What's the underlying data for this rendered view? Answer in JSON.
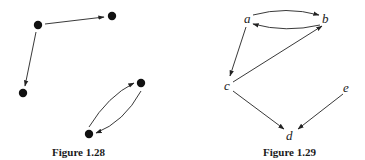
{
  "figures": [
    {
      "caption": "Figure 1.28",
      "nodes": [
        {
          "id": "n1",
          "x": 38,
          "y": 25
        },
        {
          "id": "n2",
          "x": 112,
          "y": 16
        },
        {
          "id": "n3",
          "x": 23,
          "y": 93
        },
        {
          "id": "n4",
          "x": 141,
          "y": 83
        },
        {
          "id": "n5",
          "x": 89,
          "y": 134
        }
      ],
      "edges": [
        {
          "from": "n1",
          "to": "n2"
        },
        {
          "from": "n1",
          "to": "n3"
        },
        {
          "from": "n5",
          "to": "n4"
        },
        {
          "from": "n4",
          "to": "n5"
        }
      ]
    },
    {
      "caption": "Figure 1.29",
      "nodes": [
        {
          "id": "a",
          "label": "a"
        },
        {
          "id": "b",
          "label": "b"
        },
        {
          "id": "c",
          "label": "c"
        },
        {
          "id": "d",
          "label": "d"
        },
        {
          "id": "e",
          "label": "e"
        }
      ],
      "edges": [
        {
          "from": "a",
          "to": "b"
        },
        {
          "from": "b",
          "to": "a"
        },
        {
          "from": "a",
          "to": "c"
        },
        {
          "from": "c",
          "to": "b"
        },
        {
          "from": "c",
          "to": "d"
        },
        {
          "from": "e",
          "to": "d"
        }
      ]
    }
  ]
}
